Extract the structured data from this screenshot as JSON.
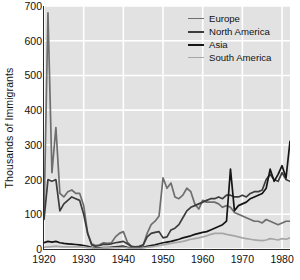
{
  "chart_data": {
    "type": "line",
    "title": "",
    "xlabel": "",
    "ylabel": "Thousands of Immigrants",
    "xlim": [
      1920,
      1982
    ],
    "ylim": [
      0,
      700
    ],
    "grid": true,
    "legend_position": "top-right",
    "xticks": [
      1920,
      1930,
      1940,
      1950,
      1960,
      1970,
      1980
    ],
    "yticks": [
      0,
      100,
      200,
      300,
      400,
      500,
      600,
      700
    ],
    "x": [
      1920,
      1921,
      1922,
      1923,
      1924,
      1925,
      1926,
      1927,
      1928,
      1929,
      1930,
      1931,
      1932,
      1933,
      1934,
      1935,
      1936,
      1937,
      1938,
      1939,
      1940,
      1941,
      1942,
      1943,
      1944,
      1945,
      1946,
      1947,
      1948,
      1949,
      1950,
      1951,
      1952,
      1953,
      1954,
      1955,
      1956,
      1957,
      1958,
      1959,
      1960,
      1961,
      1962,
      1963,
      1964,
      1965,
      1966,
      1967,
      1968,
      1969,
      1970,
      1971,
      1972,
      1973,
      1974,
      1975,
      1976,
      1977,
      1978,
      1979,
      1980,
      1981,
      1982
    ],
    "series": [
      {
        "name": "Europe",
        "color": "#6e6e6e",
        "values": [
          90,
          680,
          220,
          350,
          160,
          150,
          165,
          170,
          160,
          160,
          125,
          45,
          15,
          10,
          12,
          18,
          16,
          18,
          35,
          45,
          50,
          20,
          8,
          5,
          6,
          10,
          45,
          70,
          80,
          95,
          205,
          175,
          190,
          150,
          145,
          155,
          175,
          165,
          130,
          115,
          140,
          135,
          135,
          135,
          130,
          120,
          125,
          120,
          105,
          100,
          95,
          90,
          85,
          80,
          80,
          75,
          85,
          80,
          75,
          70,
          75,
          80,
          80
        ]
      },
      {
        "name": "North America",
        "color": "#3c3c3c",
        "values": [
          85,
          200,
          195,
          200,
          110,
          130,
          140,
          150,
          145,
          140,
          100,
          45,
          12,
          8,
          10,
          14,
          13,
          15,
          18,
          20,
          22,
          15,
          8,
          6,
          8,
          12,
          35,
          45,
          48,
          50,
          32,
          35,
          55,
          60,
          70,
          90,
          110,
          120,
          125,
          130,
          135,
          140,
          145,
          145,
          150,
          145,
          155,
          155,
          150,
          150,
          155,
          150,
          160,
          165,
          165,
          170,
          200,
          215,
          200,
          195,
          220,
          200,
          195
        ]
      },
      {
        "name": "Asia",
        "color": "#151515",
        "values": [
          18,
          22,
          20,
          22,
          18,
          16,
          15,
          14,
          13,
          12,
          10,
          8,
          5,
          3,
          3,
          4,
          4,
          5,
          6,
          7,
          8,
          5,
          3,
          2,
          3,
          5,
          8,
          10,
          12,
          15,
          18,
          20,
          22,
          25,
          28,
          32,
          35,
          38,
          42,
          45,
          48,
          50,
          55,
          60,
          65,
          70,
          80,
          230,
          110,
          125,
          130,
          135,
          145,
          150,
          155,
          160,
          175,
          230,
          195,
          215,
          240,
          205,
          310
        ]
      },
      {
        "name": "South America",
        "color": "#a6a6a6",
        "values": [
          5,
          6,
          7,
          8,
          7,
          6,
          6,
          6,
          6,
          6,
          5,
          4,
          3,
          2,
          2,
          3,
          3,
          3,
          4,
          4,
          5,
          3,
          2,
          2,
          2,
          3,
          5,
          6,
          8,
          10,
          12,
          14,
          16,
          18,
          20,
          22,
          25,
          28,
          30,
          32,
          35,
          38,
          42,
          45,
          45,
          45,
          42,
          40,
          38,
          35,
          32,
          30,
          28,
          26,
          25,
          24,
          26,
          30,
          28,
          26,
          30,
          28,
          32
        ]
      }
    ]
  },
  "legend": {
    "items": [
      {
        "label": "Europe"
      },
      {
        "label": "North America"
      },
      {
        "label": "Asia"
      },
      {
        "label": "South America"
      }
    ]
  },
  "axes": {
    "y_axis_title": "Thousands of Immigrants",
    "y_tick_labels": [
      "700",
      "600",
      "500",
      "400",
      "300",
      "200",
      "100",
      "0"
    ],
    "x_tick_labels": [
      "1920",
      "1930",
      "1940",
      "1950",
      "1960",
      "1970",
      "1980"
    ]
  },
  "style": {
    "plot_background": "#e2e2e2",
    "gridline_color": "#ffffff",
    "axis_color": "#2b2b2b",
    "text_color": "#111111"
  }
}
